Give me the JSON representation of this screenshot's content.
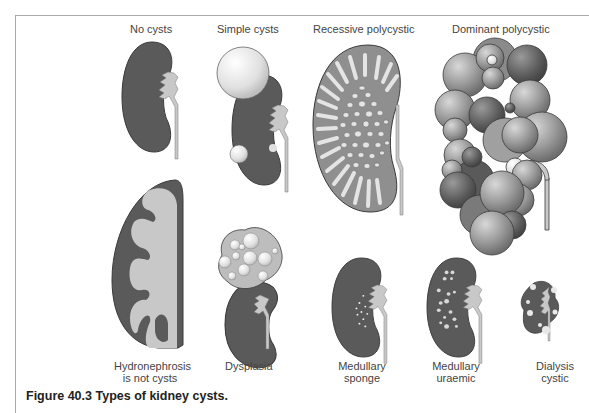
{
  "figure": {
    "caption": "Figure 40.3  Types of kidney cysts.",
    "colors": {
      "kidney_tissue": "#5a5a5a",
      "pelvis_ureter": "#c8c8c8",
      "cyst_light": "#e8e8e8",
      "recessive_fill": "#8f8f8f",
      "outline": "#3a3a3a"
    },
    "panels": [
      {
        "id": "no-cysts",
        "label_lines": [
          "No cysts"
        ]
      },
      {
        "id": "simple-cysts",
        "label_lines": [
          "Simple cysts"
        ]
      },
      {
        "id": "recessive-polycystic",
        "label_lines": [
          "Recessive polycystic"
        ]
      },
      {
        "id": "dominant-polycystic",
        "label_lines": [
          "Dominant polycystic"
        ]
      },
      {
        "id": "hydronephrosis",
        "label_lines": [
          "Hydronephrosis",
          "is not cysts"
        ]
      },
      {
        "id": "dysplasia",
        "label_lines": [
          "Dysplasia"
        ]
      },
      {
        "id": "medullary-sponge",
        "label_lines": [
          "Medullary",
          "sponge"
        ]
      },
      {
        "id": "medullary-uraemic",
        "label_lines": [
          "Medullary",
          "uraemic"
        ]
      },
      {
        "id": "dialysis-cystic",
        "label_lines": [
          "Dialysis",
          "cystic"
        ]
      }
    ]
  }
}
